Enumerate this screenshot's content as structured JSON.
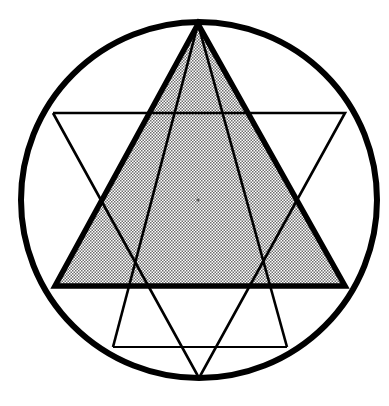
{
  "document": {
    "title": "Star of David geometric construction",
    "background_color": "#ffffff",
    "ink_color": "#000000",
    "canvas": {
      "width": 389,
      "height": 406
    }
  },
  "chart_data": {
    "type": "diagram",
    "subtitle": "Upward triangle shaded with halftone stipple; downward triangle drawn in thin outline",
    "xlabel": "",
    "ylabel": "",
    "grid": false,
    "legend_position": "none",
    "annotations": [],
    "shapes": [
      {
        "name": "circumscribed-circle",
        "type": "circle",
        "center": [
          199,
          200
        ],
        "radius": 178,
        "stroke": "#000000",
        "stroke_width": 6,
        "fill": "none"
      },
      {
        "name": "upward-triangle-shaded",
        "type": "polygon",
        "points": [
          [
            198,
            24
          ],
          [
            55,
            286
          ],
          [
            345,
            286
          ]
        ],
        "stroke": "#000000",
        "stroke_width": 5.5,
        "fill": "halftone-gray",
        "fill_color": "#b9b9b9"
      },
      {
        "name": "downward-triangle-outline",
        "type": "polygon",
        "points": [
          [
            53,
            113
          ],
          [
            345,
            113
          ],
          [
            199,
            378
          ]
        ],
        "stroke": "#000000",
        "stroke_width": 2.6,
        "fill": "none"
      },
      {
        "name": "inner-apex-triangle",
        "type": "polygon",
        "points": [
          [
            198,
            24
          ],
          [
            113,
            347
          ],
          [
            287,
            347
          ]
        ],
        "stroke": "#000000",
        "stroke_width": 2.6,
        "fill": "none"
      },
      {
        "name": "lower-chord",
        "type": "line",
        "points": [
          [
            113,
            347
          ],
          [
            287,
            347
          ]
        ],
        "stroke": "#000000",
        "stroke_width": 2.2
      },
      {
        "name": "center-dot",
        "type": "dot",
        "center": [
          198,
          200
        ],
        "radius": 1.6,
        "fill": "#5a5a5a"
      }
    ],
    "measurements": {
      "circle_center_x": 199,
      "circle_center_y": 200,
      "circle_radius": 178,
      "apex_x": 198,
      "apex_y": 24,
      "upward_base_y": 286,
      "upward_base_left_x": 55,
      "upward_base_right_x": 345,
      "downward_top_y": 113,
      "downward_top_left_x": 53,
      "downward_top_right_x": 345,
      "downward_bottom_x": 199,
      "downward_bottom_y": 378,
      "lower_chord_y": 347,
      "lower_chord_left_x": 113,
      "lower_chord_right_x": 287
    },
    "colors": {
      "ink": "#000000",
      "shade_fill": "#b9b9b9",
      "background": "#ffffff",
      "center_dot": "#5a5a5a"
    }
  }
}
